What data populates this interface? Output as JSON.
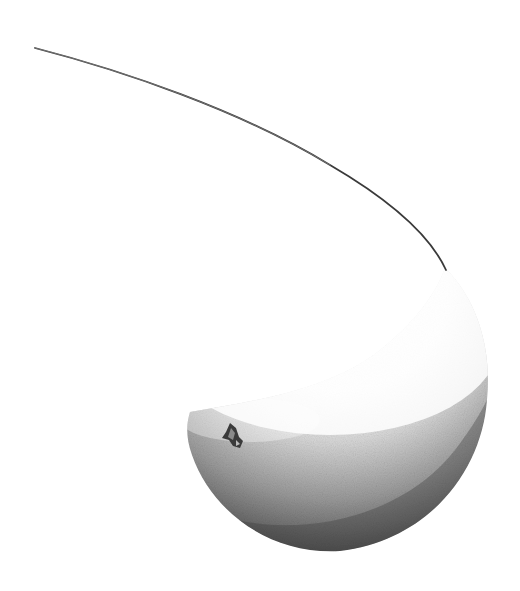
{
  "image": {
    "subject": "monochrome illustration of a fruit with a long curving stem",
    "background": "#ffffff",
    "colors": {
      "highlight": "#ffffff",
      "midtone": "#bdbdbd",
      "shadow": "#4a4a4a",
      "stem": "#3a3a3a",
      "calyx": "#2e2e2e"
    }
  }
}
